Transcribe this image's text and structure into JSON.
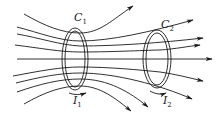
{
  "diagram": {
    "loops": [
      {
        "label": "C",
        "subscript": "1",
        "current_label": "I",
        "current_subscript": "1"
      },
      {
        "label": "C",
        "subscript": "2",
        "current_label": "I",
        "current_subscript": "2"
      }
    ],
    "field_direction": "left-to-right",
    "colors": {
      "stroke": "#1a1a1a",
      "background": "#ffffff"
    }
  }
}
